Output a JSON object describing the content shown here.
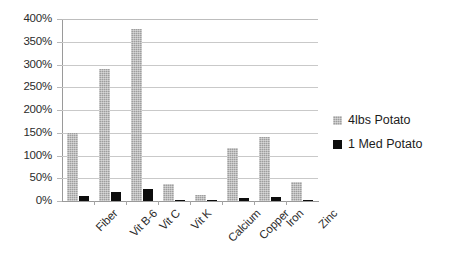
{
  "chart_data": {
    "type": "bar",
    "title": "",
    "subtitle": "",
    "xlabel": "",
    "ylabel": "",
    "categories": [
      "Fiber",
      "Vit B-6",
      "Vit C",
      "Vit K",
      "Calcium",
      "Copper",
      "Iron",
      "Zinc"
    ],
    "series": [
      {
        "name": "4lbs Potato",
        "color": "#9e9e9e",
        "values": [
          150,
          290,
          378,
          38,
          13,
          117,
          140,
          42
        ]
      },
      {
        "name": "1 Med Potato",
        "color": "#0d0d0d",
        "values": [
          10,
          20,
          27,
          3,
          2,
          7,
          8,
          3
        ]
      }
    ],
    "ylim": [
      0,
      400
    ],
    "ytick_step": 50,
    "ytick_labels": [
      "0%",
      "50%",
      "100%",
      "150%",
      "200%",
      "250%",
      "300%",
      "350%",
      "400%"
    ],
    "ytick_values": [
      0,
      50,
      100,
      150,
      200,
      250,
      300,
      350,
      400
    ],
    "grid": true,
    "grid_axis": "y",
    "legend_position": "right",
    "xtick_rotation": -45
  },
  "legend": {
    "items": [
      {
        "label": "4lbs Potato",
        "marker": "square-swatch-gray"
      },
      {
        "label": "1 Med Potato",
        "marker": "square-swatch-black"
      }
    ]
  }
}
